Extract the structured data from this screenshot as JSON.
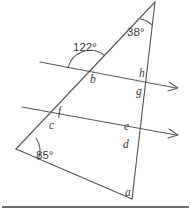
{
  "figure": {
    "type": "geometry-diagram",
    "canvas": {
      "width": 191,
      "height": 217
    },
    "colors": {
      "line": "#58585a",
      "text": "#3b3b3d",
      "baseline": "#3a3a3c",
      "background": "#ffffff"
    },
    "known_angles": [
      {
        "name": "angle-122",
        "label": "122°",
        "x": 73,
        "y": 51,
        "vertex": {
          "x": 90,
          "y": 72
        }
      },
      {
        "name": "angle-38",
        "label": "38°",
        "x": 127,
        "y": 36,
        "vertex": {
          "x": 155,
          "y": 2
        }
      },
      {
        "name": "angle-85",
        "label": "85°",
        "x": 36,
        "y": 159,
        "vertex": {
          "x": 16,
          "y": 149
        }
      }
    ],
    "unknown_angles": [
      {
        "name": "angle-b",
        "label": "b",
        "x": 90,
        "y": 83
      },
      {
        "name": "angle-h",
        "label": "h",
        "x": 139,
        "y": 77
      },
      {
        "name": "angle-g",
        "label": "g",
        "x": 136,
        "y": 95
      },
      {
        "name": "angle-f",
        "label": "f",
        "x": 58,
        "y": 115
      },
      {
        "name": "angle-c",
        "label": "c",
        "x": 49,
        "y": 129
      },
      {
        "name": "angle-e",
        "label": "e",
        "x": 124,
        "y": 130
      },
      {
        "name": "angle-d",
        "label": "d",
        "x": 123,
        "y": 148
      },
      {
        "name": "angle-a",
        "label": "a",
        "x": 125,
        "y": 196
      }
    ],
    "vertices": {
      "apex": {
        "x": 155,
        "y": 2
      },
      "left": {
        "x": 16,
        "y": 149
      },
      "bottom": {
        "x": 132,
        "y": 199
      }
    },
    "segments": [
      {
        "name": "triangle-left-side",
        "x1": 155,
        "y1": 2,
        "x2": 16,
        "y2": 149
      },
      {
        "name": "triangle-right-side",
        "x1": 155,
        "y1": 2,
        "x2": 132,
        "y2": 199
      },
      {
        "name": "triangle-base",
        "x1": 16,
        "y1": 149,
        "x2": 132,
        "y2": 199
      },
      {
        "name": "transversal-upper",
        "x1": 40,
        "y1": 62,
        "x2": 176,
        "y2": 88
      },
      {
        "name": "transversal-lower",
        "x1": 22,
        "y1": 107,
        "x2": 176,
        "y2": 135
      }
    ],
    "ray_arrows": [
      {
        "name": "arrow-upper-right",
        "x": 176,
        "y": 88
      },
      {
        "name": "arrow-lower-right",
        "x": 176,
        "y": 135
      }
    ],
    "baseline": {
      "name": "bottom-rule",
      "x1": 2,
      "y1": 207,
      "x2": 189,
      "y2": 207
    }
  }
}
